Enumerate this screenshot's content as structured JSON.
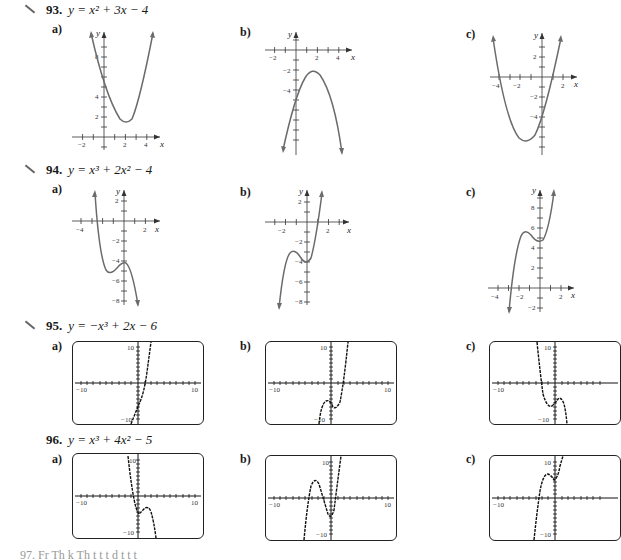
{
  "problems": [
    {
      "number": "93.",
      "equation": "y = x² + 3x − 4",
      "has_pencil_icon": true,
      "options": [
        {
          "label": "a)",
          "type": "textbook-graph",
          "function": "y = x^2 - 3x + 4 (vertex ≈ (1.5, 1.75))",
          "x_ticks": [
            "−2",
            "2",
            "4"
          ],
          "y_ticks": [
            "2",
            "4",
            "8"
          ]
        },
        {
          "label": "b)",
          "type": "textbook-graph",
          "function": "downward parabola, vertex ≈ (1.5, −1.75)",
          "x_ticks": [
            "−2",
            "2",
            "4"
          ],
          "y_ticks": [
            "−2",
            "−4"
          ]
        },
        {
          "label": "c)",
          "type": "textbook-graph",
          "function": "upward parabola, vertex ≈ (−1.5, −6.25)",
          "x_ticks": [
            "−4",
            "−2",
            "2"
          ],
          "y_ticks": [
            "2",
            "−2",
            "−4"
          ]
        }
      ]
    },
    {
      "number": "94.",
      "equation": "y = x³ + 2x² − 4",
      "has_pencil_icon": true,
      "options": [
        {
          "label": "a)",
          "type": "textbook-graph",
          "function": "cubic, local min ≈ (−1.3, −5), local max ≈ (0, −4)",
          "x_ticks": [
            "−4",
            "2"
          ],
          "y_ticks": [
            "2",
            "−2",
            "−4",
            "−6",
            "−8"
          ]
        },
        {
          "label": "b)",
          "type": "textbook-graph",
          "function": "cubic, local max ≈ (−1.3, −2.8), local min ≈ (0, −4)",
          "x_ticks": [
            "−2",
            "2"
          ],
          "y_ticks": [
            "2",
            "−2",
            "−4",
            "−6",
            "−8"
          ]
        },
        {
          "label": "c)",
          "type": "textbook-graph",
          "function": "cubic, local max ≈ (−1.3, 5.2), local min ≈ (0, 4)",
          "x_ticks": [
            "−4",
            "−2",
            "2"
          ],
          "y_ticks": [
            "8",
            "6",
            "4",
            "2",
            "−2"
          ]
        }
      ]
    },
    {
      "number": "95.",
      "equation": "y = −x³ + 2x − 6",
      "has_pencil_icon": true,
      "options": [
        {
          "label": "a)",
          "type": "calculator-screen",
          "xmin": "−10",
          "xmax": "10",
          "ymax": "10",
          "ymin": "−10"
        },
        {
          "label": "b)",
          "type": "calculator-screen",
          "xmin": "−10",
          "xmax": "10",
          "ymax": "10",
          "ymin": "−10"
        },
        {
          "label": "c)",
          "type": "calculator-screen",
          "xmin": "−10",
          "xmax": "10",
          "ymax": "10",
          "ymin": "−10"
        }
      ]
    },
    {
      "number": "96.",
      "equation": "y = x³ + 4x² − 5",
      "has_pencil_icon": false,
      "options": [
        {
          "label": "a)",
          "type": "calculator-screen",
          "xmin": "−10",
          "xmax": "10",
          "ymax": "10",
          "ymin": "−10"
        },
        {
          "label": "b)",
          "type": "calculator-screen",
          "xmin": "−10",
          "xmax": "10",
          "ymax": "10",
          "ymin": "−10"
        },
        {
          "label": "c)",
          "type": "calculator-screen",
          "xmin": "−10",
          "xmax": "10",
          "ymax": "10",
          "ymin": "−10"
        }
      ]
    }
  ],
  "axis_labels": {
    "x": "x",
    "y": "y"
  },
  "colors": {
    "curve": "#6b6b6b",
    "calc_curve": "#1a1a1a",
    "axis": "#333333",
    "text": "#1a1a1a"
  },
  "footer_partial": "97.  Fr  Th  k   Th    t   t   t   d   t   t   t"
}
